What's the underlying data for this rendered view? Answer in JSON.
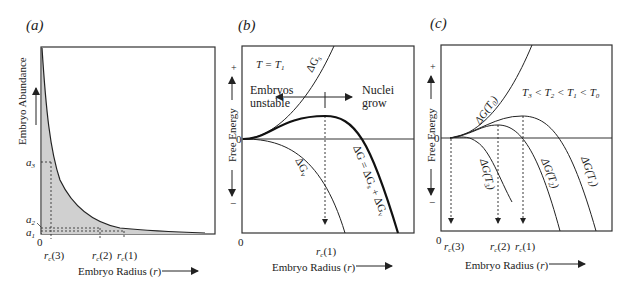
{
  "panel_a": {
    "tag": "(a)",
    "ylabel": "Embryo Abundance",
    "xlabel": "Embryo Radius (r)",
    "origin": "0",
    "yticks": [
      "a3",
      "a2",
      "a1"
    ],
    "xticks": [
      "rc(3)",
      "rc(2)",
      "rc(1)"
    ]
  },
  "panel_b": {
    "tag": "(b)",
    "condition": "T = T1",
    "ylabel": "Free Energy",
    "plus": "+",
    "minus": "−",
    "xlabel": "Embryo Radius (r)",
    "origin": "0",
    "left_note": [
      "Embryos",
      "unstable"
    ],
    "right_note": [
      "Nuclei",
      "grow"
    ],
    "curve_surface": "ΔGs",
    "curve_volume": "ΔGv",
    "curve_total": "ΔG = ΔGs + ΔGv",
    "xtick": "rc(1)"
  },
  "panel_c": {
    "tag": "(c)",
    "condition": "T3 < T2 < T1 < T0",
    "ylabel": "Free Energy",
    "plus": "+",
    "minus": "−",
    "xlabel": "Embryo Radius (r)",
    "origin": "0",
    "curves": [
      "ΔG(T0)",
      "ΔG(T1)",
      "ΔG(T2)",
      "ΔG(T3)"
    ],
    "xticks": [
      "rc(3)",
      "rc(2)",
      "rc(1)"
    ]
  }
}
